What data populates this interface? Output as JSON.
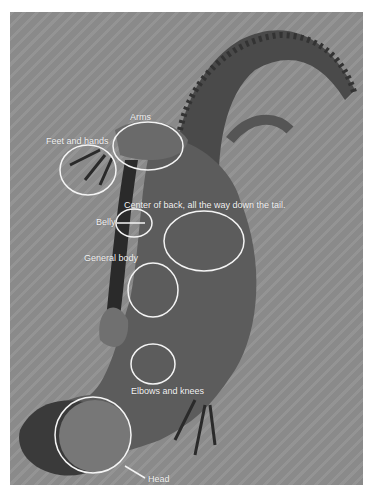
{
  "image": {
    "description": "Grayscale photograph of a lizard seen from above, annotated with white ellipses and labels marking body regions",
    "background_color": "#8e8e8e",
    "annotation_color": "#f4f4f4"
  },
  "annotations": [
    {
      "label": "Arms",
      "x": 130,
      "y": 117
    },
    {
      "label": "Feet and hands",
      "x": 46,
      "y": 140
    },
    {
      "label": "Center of back, all the way down the tail.",
      "x": 124,
      "y": 205
    },
    {
      "label": "Belly",
      "x": 96,
      "y": 219
    },
    {
      "label": "General body",
      "x": 84,
      "y": 256
    },
    {
      "label": "Elbows and knees",
      "x": 131,
      "y": 387
    },
    {
      "label": "Head",
      "x": 148,
      "y": 474
    }
  ]
}
